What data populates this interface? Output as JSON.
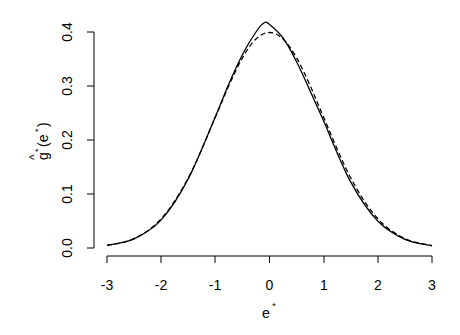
{
  "chart_data": {
    "type": "line",
    "title": "",
    "xlabel": "e*",
    "ylabel": "ĝ*(e*)",
    "xlim": [
      -3,
      3
    ],
    "ylim": [
      0,
      0.4
    ],
    "grid": false,
    "legend": null,
    "x_ticks": [
      "-3",
      "-2",
      "-1",
      "0",
      "1",
      "2",
      "3"
    ],
    "y_ticks": [
      "0.0",
      "0.1",
      "0.2",
      "0.3",
      "0.4"
    ],
    "series": [
      {
        "name": "estimated density (solid)",
        "style": "solid",
        "x": [
          -3.0,
          -2.5,
          -2.0,
          -1.5,
          -1.0,
          -0.75,
          -0.5,
          -0.25,
          -0.1,
          0.0,
          0.25,
          0.5,
          0.75,
          1.0,
          1.5,
          2.0,
          2.5,
          3.0
        ],
        "values": [
          0.005,
          0.017,
          0.052,
          0.128,
          0.243,
          0.304,
          0.358,
          0.4,
          0.417,
          0.414,
          0.389,
          0.345,
          0.291,
          0.235,
          0.122,
          0.05,
          0.016,
          0.004
        ]
      },
      {
        "name": "standard normal (dashed)",
        "style": "dashed",
        "x": [
          -3.0,
          -2.5,
          -2.0,
          -1.5,
          -1.0,
          -0.75,
          -0.5,
          -0.25,
          0.0,
          0.25,
          0.5,
          0.75,
          1.0,
          1.5,
          2.0,
          2.5,
          3.0
        ],
        "values": [
          0.0044,
          0.0175,
          0.054,
          0.1295,
          0.242,
          0.301,
          0.352,
          0.387,
          0.399,
          0.387,
          0.352,
          0.301,
          0.242,
          0.1295,
          0.054,
          0.0175,
          0.0044
        ]
      }
    ]
  },
  "axes": {
    "x_title_main": "e",
    "x_title_sup": "*",
    "y_title_hat": "^",
    "y_title_g": "g",
    "y_title_sup": "*",
    "y_title_rest": "(e",
    "y_title_sup2": "*",
    "y_title_close": ")"
  }
}
